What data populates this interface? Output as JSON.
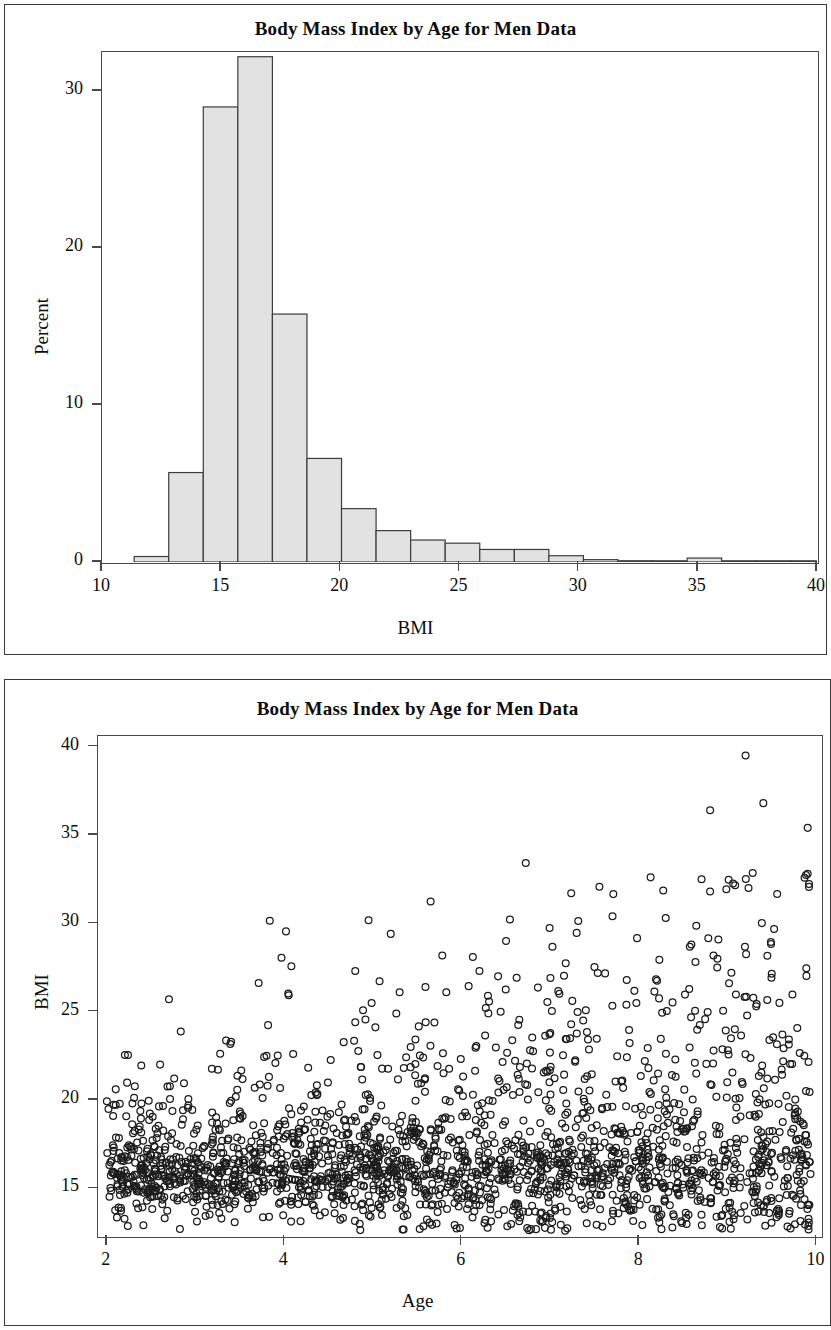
{
  "document": {
    "panel_count": 2
  },
  "panels": [
    {
      "name": "histogram-panel",
      "title": "Body Mass Index by Age for Men Data",
      "xlabel": "BMI",
      "ylabel": "Percent"
    },
    {
      "name": "scatter-panel",
      "title": "Body Mass Index by Age for Men Data",
      "xlabel": "Age",
      "ylabel": "BMI"
    }
  ],
  "chart_data": [
    {
      "type": "bar",
      "name": "bmi-histogram",
      "title": "Body Mass Index by Age for Men Data",
      "xlabel": "BMI",
      "ylabel": "Percent",
      "xlim": [
        10,
        40
      ],
      "ylim": [
        0,
        32.5
      ],
      "xticks": [
        10,
        15,
        20,
        25,
        30,
        35,
        40
      ],
      "xticklabels": [
        "10",
        "15",
        "20",
        "25",
        "30",
        "35",
        "40"
      ],
      "yticks": [
        0,
        10,
        20,
        30
      ],
      "yticklabels": [
        "0",
        "10",
        "20",
        "30"
      ],
      "grid": false,
      "legend": false,
      "bin_width": 1.45,
      "bin_starts": [
        11.35,
        12.8,
        14.25,
        15.7,
        17.15,
        18.6,
        20.05,
        21.5,
        22.95,
        24.4,
        25.85,
        27.3,
        28.75,
        30.2,
        31.65,
        33.1,
        34.55,
        36.0,
        37.45,
        38.9
      ],
      "bin_centers": [
        12.07,
        13.52,
        14.97,
        16.42,
        17.87,
        19.32,
        20.77,
        22.22,
        23.67,
        25.12,
        26.57,
        28.02,
        29.47,
        30.92,
        32.37,
        33.82,
        35.27,
        36.72,
        38.17,
        39.62
      ],
      "values": [
        0.35,
        5.7,
        29.0,
        32.2,
        15.8,
        6.6,
        3.4,
        2.0,
        1.4,
        1.2,
        0.8,
        0.8,
        0.4,
        0.15,
        0.08,
        0.05,
        0.25,
        0.06,
        0.04,
        0.04
      ],
      "bar_fill": "#e2e2e2",
      "bar_edge": "#3c3c3c"
    },
    {
      "type": "scatter",
      "name": "bmi-vs-age-scatter",
      "title": "Body Mass Index by Age for Men Data",
      "xlabel": "Age",
      "ylabel": "BMI",
      "xlim": [
        1.9,
        10.05
      ],
      "ylim": [
        12.3,
        40.6
      ],
      "xticks": [
        2,
        4,
        6,
        8,
        10
      ],
      "xticklabels": [
        "2",
        "4",
        "6",
        "8",
        "10"
      ],
      "yticks": [
        15,
        20,
        25,
        30,
        35,
        40
      ],
      "yticklabels": [
        "15",
        "20",
        "25",
        "30",
        "35",
        "40"
      ],
      "grid": false,
      "legend": false,
      "marker": "open-circle",
      "marker_color": "#1c1c1c",
      "marker_radius": 3.4,
      "n_points": 2200,
      "trend": "BMI median ~16 at age 2 rising slightly to ~16.8 at age 10; spread widens with age; upper outliers up to 39.5",
      "notable_outliers": [
        {
          "age": 2.1,
          "bmi": 20.6
        },
        {
          "age": 2.7,
          "bmi": 25.7
        },
        {
          "age": 2.6,
          "bmi": 22.0
        },
        {
          "age": 3.4,
          "bmi": 23.3
        },
        {
          "age": 3.8,
          "bmi": 22.5
        },
        {
          "age": 4.1,
          "bmi": 22.6
        },
        {
          "age": 4.8,
          "bmi": 27.3
        },
        {
          "age": 4.8,
          "bmi": 24.4
        },
        {
          "age": 5.2,
          "bmi": 29.4
        },
        {
          "age": 5.3,
          "bmi": 26.1
        },
        {
          "age": 6.2,
          "bmi": 27.3
        },
        {
          "age": 6.3,
          "bmi": 24.9
        },
        {
          "age": 6.5,
          "bmi": 29.0
        },
        {
          "age": 7.0,
          "bmi": 26.9
        },
        {
          "age": 7.7,
          "bmi": 30.4
        },
        {
          "age": 8.3,
          "bmi": 30.3
        },
        {
          "age": 8.8,
          "bmi": 31.8
        },
        {
          "age": 8.8,
          "bmi": 36.4
        },
        {
          "age": 9.2,
          "bmi": 39.5
        },
        {
          "age": 9.4,
          "bmi": 36.8
        },
        {
          "age": 9.9,
          "bmi": 35.4
        },
        {
          "age": 9.9,
          "bmi": 32.8
        }
      ]
    }
  ]
}
